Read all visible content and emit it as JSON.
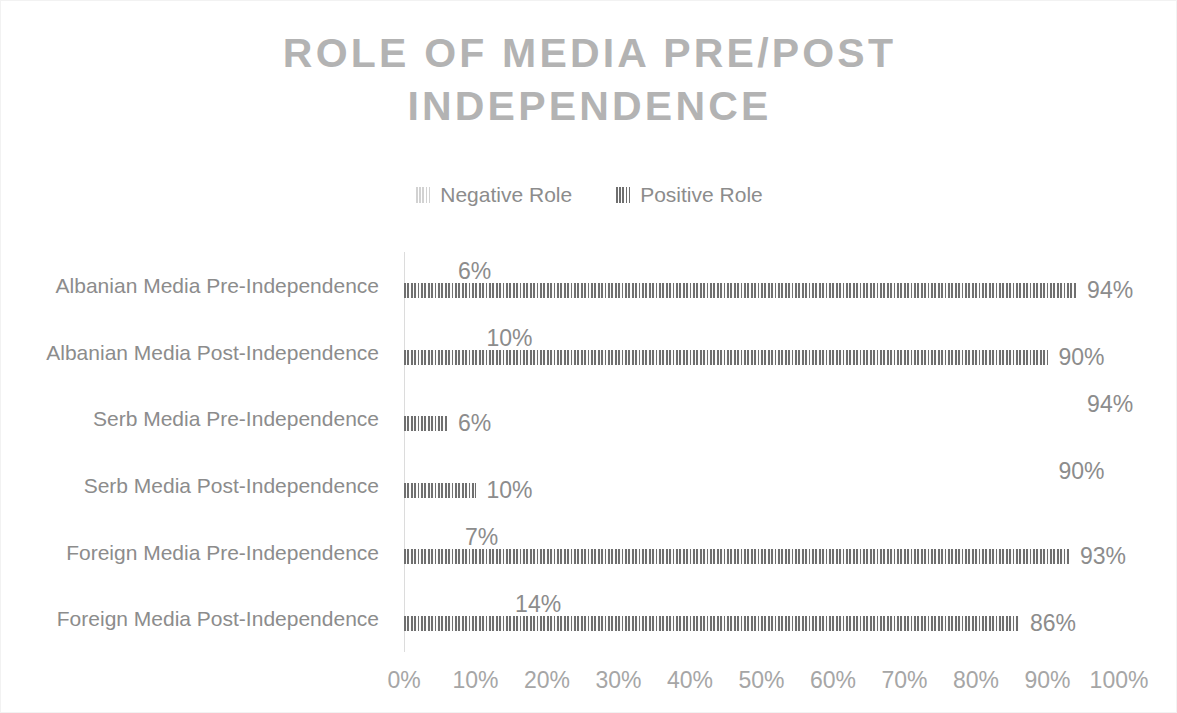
{
  "chart_data": {
    "type": "bar",
    "orientation": "horizontal",
    "title": "ROLE OF MEDIA PRE/POST\nINDEPENDENCE",
    "xlabel": "",
    "ylabel": "",
    "xlim": [
      0,
      100
    ],
    "grid": false,
    "legend_position": "top-center",
    "categories": [
      "Albanian Media Pre-Independence",
      "Albanian Media Post-Independence",
      "Serb Media Pre-Independence",
      "Serb Media Post-Independence",
      "Foreign Media Pre-Independence",
      "Foreign Media Post-Independence"
    ],
    "series": [
      {
        "name": "Negative Role",
        "color": "#d2d2d2",
        "values": [
          6,
          10,
          94,
          90,
          7,
          14
        ],
        "labels": [
          "6%",
          "10%",
          "94%",
          "90%",
          "7%",
          "14%"
        ]
      },
      {
        "name": "Positive Role",
        "color": "#6f6f6f",
        "values": [
          94,
          90,
          6,
          10,
          93,
          86
        ],
        "labels": [
          "94%",
          "90%",
          "6%",
          "10%",
          "93%",
          "86%"
        ]
      }
    ],
    "x_ticks": [
      "0%",
      "10%",
      "20%",
      "30%",
      "40%",
      "50%",
      "60%",
      "70%",
      "80%",
      "90%",
      "100%"
    ],
    "x_tick_values": [
      0,
      10,
      20,
      30,
      40,
      50,
      60,
      70,
      80,
      90,
      100
    ]
  },
  "colors": {
    "title": "#b3b3b3",
    "text": "#8c8c8c",
    "axis": "#dcdcdc",
    "tick": "#a6a6a6",
    "negative": "#d2d2d2",
    "positive": "#6f6f6f",
    "background": "#ffffff"
  }
}
